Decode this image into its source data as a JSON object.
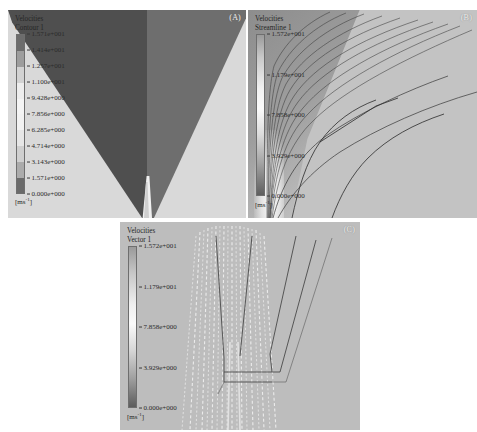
{
  "figure": {
    "background": "#ffffff",
    "panel_background": "#b9b9b9"
  },
  "panels": [
    {
      "id": "panel-a",
      "letter": "(A)",
      "legend": {
        "title_line1": "Velocities",
        "title_line2": "Contour 1",
        "units": "[ms",
        "units_exp": "-1",
        "units_close": "]",
        "ticks": [
          "1.571e+001",
          "1.414e+001",
          "1.257e+001",
          "1.100e+001",
          "9.428e+000",
          "7.856e+000",
          "6.285e+000",
          "4.714e+000",
          "3.143e+000",
          "1.571e+000",
          "0.000e+000"
        ],
        "bands": [
          "#6c6c6c",
          "#9d9d9d",
          "#d2d2d2",
          "#ededed",
          "#f4f4f4",
          "#f2f2f2",
          "#e6e6e6",
          "#cfcfcf",
          "#ababab",
          "#6a6a6a"
        ]
      },
      "scene": {
        "field_color": "#d9d9d9",
        "left_wedge_color": "#4f4f4f",
        "right_wedge_color": "#6e6e6e",
        "tip_color": "#f0f0f0"
      }
    },
    {
      "id": "panel-b",
      "letter": "(B)",
      "legend": {
        "title_line1": "Velocities",
        "title_line2": "Streamline 1",
        "units": "[ms",
        "units_exp": "-1",
        "units_close": "]",
        "ticks": [
          "1.572e+001",
          "1.179e+001",
          "7.858e+000",
          "3.929e+000",
          "0.000e+000"
        ],
        "gradient": "linear-gradient(to bottom, #9a9a9a 0%, #c9c9c9 14%, #f2f2f2 34%, #fbfbfb 46%, #dcdcdc 62%, #a4a4a4 80%, #5e5e5e 100%)"
      },
      "scene": {
        "field_color": "#c3c3c3",
        "plume_color": "#8f8f8f",
        "streamline_color": "#3e3e3e"
      }
    },
    {
      "id": "panel-c",
      "letter": "(C)",
      "legend": {
        "title_line1": "Velocities",
        "title_line2": "Vector 1",
        "units": "[ms",
        "units_exp": "-1",
        "units_close": "]",
        "ticks": [
          "1.572e+001",
          "1.179e+001",
          "7.858e+000",
          "3.929e+000",
          "0.000e+000"
        ],
        "gradient": "linear-gradient(to bottom, #9a9a9a 0%, #c6c6c6 16%, #efefef 36%, #fafafa 48%, #d8d8d8 64%, #a0a0a0 82%, #5c5c5c 100%)"
      },
      "scene": {
        "field_color": "#bdbdbd",
        "vector_color": "#f6f6f6",
        "outline_color": "#4a4a4a"
      }
    }
  ],
  "chart_data": {
    "type": "heatmap",
    "subfigures": [
      {
        "label": "(A)",
        "render_mode": "Contour 1",
        "quantity": "Velocities",
        "units": "m s^-1",
        "colorbar_min": 0.0,
        "colorbar_max": 15.71,
        "tick_values": [
          15.71,
          14.14,
          12.57,
          11.0,
          9.428,
          7.856,
          6.285,
          4.714,
          3.143,
          1.571,
          0.0
        ],
        "n_bands": 10
      },
      {
        "label": "(B)",
        "render_mode": "Streamline 1",
        "quantity": "Velocities",
        "units": "m s^-1",
        "colorbar_min": 0.0,
        "colorbar_max": 15.72,
        "tick_values": [
          15.72,
          11.79,
          7.858,
          3.929,
          0.0
        ],
        "n_bands": 0
      },
      {
        "label": "(C)",
        "render_mode": "Vector 1",
        "quantity": "Velocities",
        "units": "m s^-1",
        "colorbar_min": 0.0,
        "colorbar_max": 15.72,
        "tick_values": [
          15.72,
          11.79,
          7.858,
          3.929,
          0.0
        ],
        "n_bands": 0
      }
    ],
    "legend_position": "inside-top-left",
    "grid": false
  }
}
